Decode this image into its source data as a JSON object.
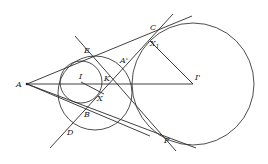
{
  "figure": {
    "type": "geometry-diagram",
    "points": {
      "A": {
        "label": "A",
        "x": 27,
        "y": 84
      },
      "I": {
        "label": "I",
        "x": 81,
        "y": 82
      },
      "I_prime": {
        "label": "I'",
        "x": 193,
        "y": 84
      },
      "E": {
        "label": "E",
        "x": 88,
        "y": 47
      },
      "K": {
        "label": "K",
        "x": 110,
        "y": 84
      },
      "A_prime": {
        "label": "A'",
        "x": 121,
        "y": 62
      },
      "X": {
        "label": "X",
        "x": 104,
        "y": 93
      },
      "B": {
        "label": "B",
        "x": 88,
        "y": 112
      },
      "D": {
        "label": "D",
        "x": 70,
        "y": 129
      },
      "C": {
        "label": "C",
        "x": 155,
        "y": 30
      },
      "X1": {
        "label": "X",
        "sub": "1",
        "x": 150,
        "y": 41
      },
      "F": {
        "label": "F",
        "x": 175,
        "y": 137
      }
    },
    "circles": [
      {
        "name": "incircle-I",
        "cx": 81,
        "cy": 82,
        "r": 21
      },
      {
        "name": "middle-circle",
        "cx": 95,
        "cy": 93,
        "r": 37
      },
      {
        "name": "excircle-I-prime",
        "cx": 193,
        "cy": 84,
        "r": 61
      }
    ]
  }
}
